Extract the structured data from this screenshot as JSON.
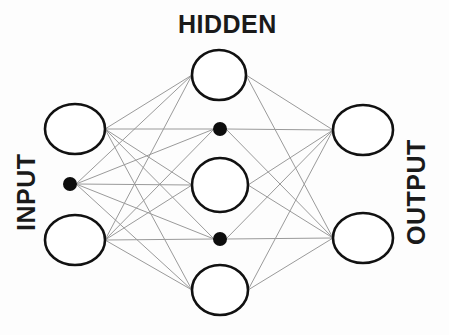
{
  "diagram": {
    "type": "neural-network",
    "width": 449,
    "height": 335,
    "background_color": "#fdfdfd"
  },
  "labels": {
    "input": "INPUT",
    "hidden": "HIDDEN",
    "output": "OUTPUT"
  },
  "style": {
    "node_stroke_color": "#111111",
    "node_fill_color": "#ffffff",
    "node_stroke_width": 2.6,
    "edge_color": "#9a9a9a",
    "edge_width": 1.0,
    "ellipsis_color": "#0d0d0d",
    "label_color": "#1a1a1a"
  },
  "layers": [
    {
      "id": "input",
      "name": "INPUT",
      "label_rotation": -90,
      "label_x": 27,
      "label_y": 186,
      "x": 75,
      "units": [
        {
          "id": "i1",
          "kind": "neuron",
          "cx": 75,
          "cy": 129,
          "rx": 30,
          "ry": 25
        },
        {
          "id": "i-dots",
          "kind": "ellipsis",
          "cx": 70,
          "cy": 184,
          "r": 7
        },
        {
          "id": "i2",
          "kind": "neuron",
          "cx": 75,
          "cy": 240,
          "rx": 30,
          "ry": 25
        }
      ]
    },
    {
      "id": "hidden",
      "name": "HIDDEN",
      "label_rotation": 0,
      "label_x": 231,
      "label_y": 25,
      "x": 220,
      "units": [
        {
          "id": "h1",
          "kind": "neuron",
          "cx": 219,
          "cy": 75,
          "rx": 27,
          "ry": 25
        },
        {
          "id": "h-dots-1",
          "kind": "ellipsis",
          "cx": 220,
          "cy": 129,
          "r": 7
        },
        {
          "id": "h2",
          "kind": "neuron",
          "cx": 220,
          "cy": 185,
          "rx": 28,
          "ry": 27
        },
        {
          "id": "h-dots-2",
          "kind": "ellipsis",
          "cx": 220,
          "cy": 239,
          "r": 7
        },
        {
          "id": "h3",
          "kind": "neuron",
          "cx": 220,
          "cy": 290,
          "rx": 28,
          "ry": 25
        }
      ]
    },
    {
      "id": "output",
      "name": "OUTPUT",
      "label_rotation": -90,
      "label_x": 417,
      "label_y": 190,
      "x": 363,
      "units": [
        {
          "id": "o1",
          "kind": "neuron",
          "cx": 363,
          "cy": 130,
          "rx": 30,
          "ry": 25
        },
        {
          "id": "o2",
          "kind": "neuron",
          "cx": 363,
          "cy": 238,
          "rx": 30,
          "ry": 25
        }
      ]
    }
  ],
  "connections": {
    "description": "fully connected between adjacent layers",
    "input_to_hidden": [
      [
        "i1",
        "h1"
      ],
      [
        "i1",
        "h-dots-1"
      ],
      [
        "i1",
        "h2"
      ],
      [
        "i1",
        "h-dots-2"
      ],
      [
        "i1",
        "h3"
      ],
      [
        "i-dots",
        "h1"
      ],
      [
        "i-dots",
        "h-dots-1"
      ],
      [
        "i-dots",
        "h2"
      ],
      [
        "i-dots",
        "h-dots-2"
      ],
      [
        "i-dots",
        "h3"
      ],
      [
        "i2",
        "h1"
      ],
      [
        "i2",
        "h-dots-1"
      ],
      [
        "i2",
        "h2"
      ],
      [
        "i2",
        "h-dots-2"
      ],
      [
        "i2",
        "h3"
      ]
    ],
    "hidden_to_output": [
      [
        "h1",
        "o1"
      ],
      [
        "h1",
        "o2"
      ],
      [
        "h-dots-1",
        "o1"
      ],
      [
        "h-dots-1",
        "o2"
      ],
      [
        "h2",
        "o1"
      ],
      [
        "h2",
        "o2"
      ],
      [
        "h-dots-2",
        "o1"
      ],
      [
        "h-dots-2",
        "o2"
      ],
      [
        "h3",
        "o1"
      ],
      [
        "h3",
        "o2"
      ]
    ]
  }
}
